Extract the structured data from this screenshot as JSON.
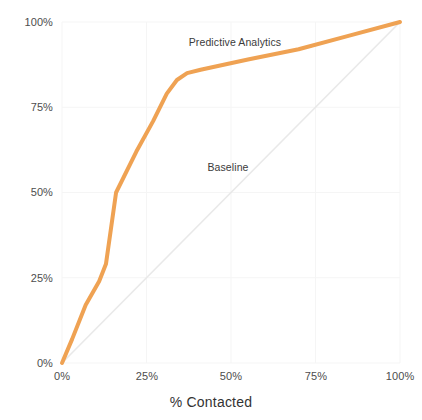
{
  "chart_data": {
    "type": "line",
    "title": "",
    "subtitle": "",
    "xlabel": "% Contacted",
    "ylabel": "% ",
    "xlim": [
      0,
      100
    ],
    "ylim": [
      0,
      100
    ],
    "grid": true,
    "legend_position": "inline-annotation",
    "x_ticks": [
      "0%",
      "25%",
      "50%",
      "75%",
      "100%"
    ],
    "x_tick_values": [
      0,
      25,
      50,
      75,
      100
    ],
    "y_ticks": [
      "0%",
      "25%",
      "50%",
      "75%",
      "100%"
    ],
    "y_tick_values": [
      0,
      25,
      50,
      75,
      100
    ],
    "series": [
      {
        "name": "Baseline",
        "color": "#e9e9e9",
        "width": 1.6,
        "annotation": "Baseline",
        "annotation_x": 49,
        "annotation_y": 57,
        "x": [
          0,
          100
        ],
        "values": [
          0,
          100
        ]
      },
      {
        "name": "Predictive Analytics",
        "color": "#efa253",
        "width": 4,
        "annotation": "Predictive Analytics",
        "annotation_x": 51,
        "annotation_y": 94,
        "x": [
          0,
          3,
          7,
          11,
          13,
          16,
          22,
          27,
          31,
          34,
          37,
          41,
          55,
          70,
          85,
          100
        ],
        "values": [
          0,
          7,
          17,
          24,
          29,
          50,
          62,
          71,
          79,
          83,
          85,
          86,
          89,
          92,
          96,
          100
        ]
      }
    ]
  },
  "axes": {
    "x_title": "% Contacted",
    "y_title_clipped": "%"
  },
  "colors": {
    "predictive": "#efa253",
    "baseline": "#e9e9e9",
    "grid": "#f5f5f5",
    "tick_text": "#4d4d4d",
    "axis_title_text": "#333333",
    "background": "#ffffff"
  }
}
